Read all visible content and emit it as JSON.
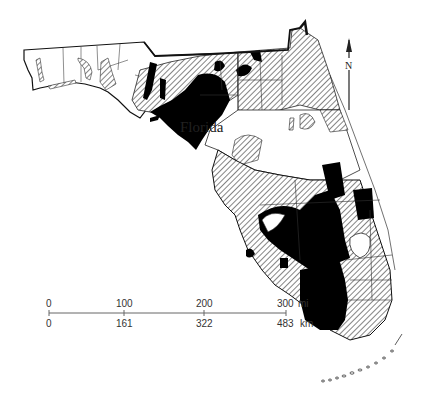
{
  "map": {
    "title": "Florida",
    "north_arrow": {
      "label": "N"
    },
    "scale_bar": {
      "miles": {
        "ticks": [
          "0",
          "100",
          "200",
          "300"
        ],
        "unit": "mi"
      },
      "kilometers": {
        "ticks": [
          "0",
          "161",
          "322",
          "483"
        ],
        "unit": "km"
      }
    },
    "legend_fills": {
      "solid": "#000000",
      "hatched": "diagonal-hatch",
      "blank": "#ffffff"
    },
    "colors": {
      "ink": "#1a1a1a",
      "paper": "#ffffff"
    }
  }
}
